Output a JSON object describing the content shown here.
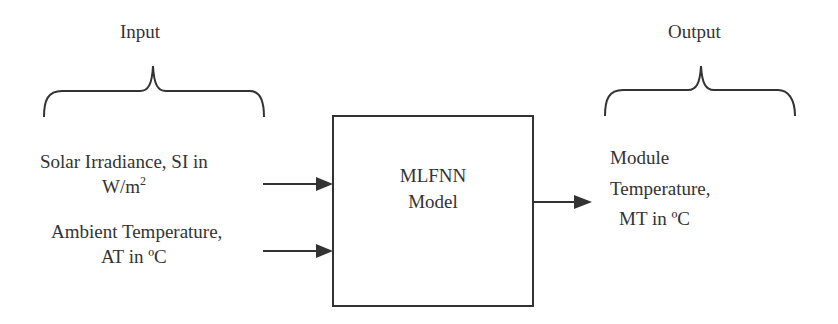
{
  "diagram": {
    "input_section": {
      "heading": "Input",
      "items": [
        {
          "line1": "Solar Irradiance, SI in",
          "line2_base": "W/m",
          "line2_sup": "2"
        },
        {
          "line1": "Ambient Temperature,",
          "line2": "AT in ºC"
        }
      ]
    },
    "model_block": {
      "line1": "MLFNN",
      "line2": "Model"
    },
    "output_section": {
      "heading": "Output",
      "item": {
        "line1": "Module",
        "line2": "Temperature,",
        "line3": "MT in ºC"
      }
    },
    "colors": {
      "stroke": "#333333",
      "background": "#ffffff"
    }
  }
}
